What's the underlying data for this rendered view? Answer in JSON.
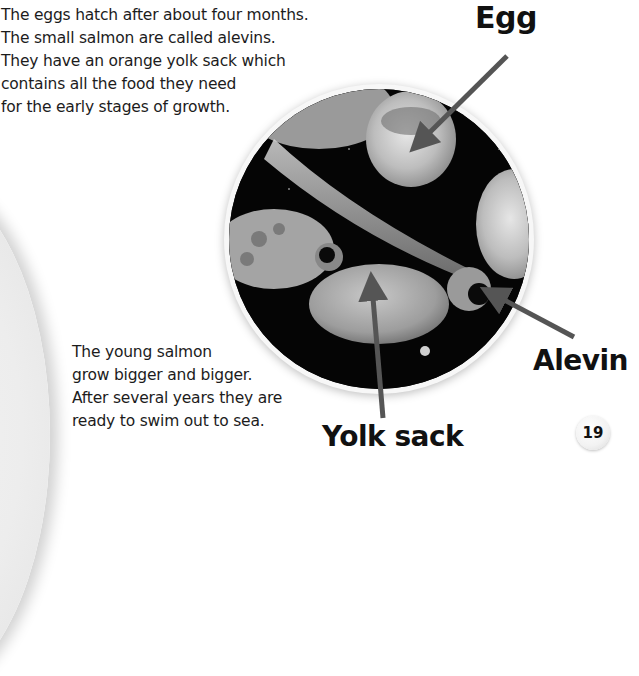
{
  "page": {
    "number": "19",
    "paragraph_top": [
      "The eggs hatch after about four months.",
      "The small salmon are called alevins.",
      "They have an orange yolk sack which",
      "contains all the food they need",
      "for the early stages of growth."
    ],
    "paragraph_bottom": [
      "The young salmon",
      "grow bigger and bigger.",
      "After several years they are",
      "ready to swim out to sea."
    ]
  },
  "photo": {
    "subject": "Salmon eggs and alevins on dark background",
    "labels": {
      "egg": "Egg",
      "alevin": "Alevin",
      "yolk_sack": "Yolk sack"
    }
  },
  "colors": {
    "text": "#1c1c1c",
    "pointer": "#555555",
    "photo_bg": "#050505",
    "page_bg": "#ffffff"
  }
}
